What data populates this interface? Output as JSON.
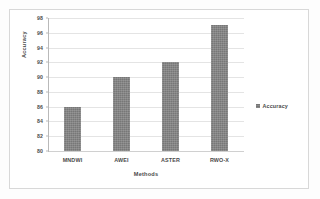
{
  "chart_data": {
    "type": "bar",
    "title": "",
    "categories": [
      "MNDWI",
      "AWEI",
      "ASTER",
      "RWO-X"
    ],
    "values": [
      86,
      90,
      92,
      97
    ],
    "series": [
      {
        "name": "Accuracy",
        "values": [
          86,
          90,
          92,
          97
        ]
      }
    ],
    "xlabel": "Methods",
    "ylabel": "Accuracy",
    "ylim": [
      80,
      98
    ],
    "ytick_step": 2,
    "yticks": [
      98,
      96,
      94,
      92,
      90,
      88,
      86,
      84,
      82,
      80
    ],
    "grid": true,
    "legend": {
      "position": "right",
      "entries": [
        "Accuracy"
      ]
    },
    "bar_color": "#777777",
    "gridline_color": "#e4e4e4",
    "axis_color": "#b9b9b9",
    "background": "#ffffff"
  }
}
